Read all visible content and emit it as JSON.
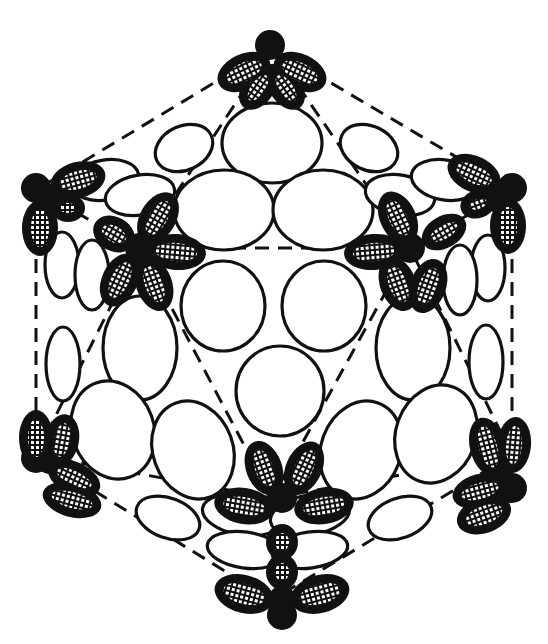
{
  "diagram": {
    "width": 548,
    "height": 644,
    "colors": {
      "background": "#ffffff",
      "stroke": "#111111",
      "penton_fill": "#111111",
      "hatch_bg": "#ffffff"
    },
    "edges": [
      [
        272,
        48,
        512,
        190
      ],
      [
        272,
        48,
        36,
        190
      ],
      [
        36,
        190,
        36,
        455
      ],
      [
        512,
        190,
        512,
        455
      ],
      [
        36,
        455,
        272,
        600
      ],
      [
        512,
        455,
        272,
        600
      ],
      [
        140,
        248,
        410,
        248
      ],
      [
        140,
        248,
        272,
        498
      ],
      [
        410,
        248,
        272,
        498
      ],
      [
        272,
        48,
        140,
        248
      ],
      [
        272,
        48,
        410,
        248
      ],
      [
        36,
        190,
        140,
        248
      ],
      [
        512,
        190,
        410,
        248
      ],
      [
        36,
        455,
        140,
        248
      ],
      [
        512,
        455,
        410,
        248
      ],
      [
        36,
        455,
        272,
        498
      ],
      [
        512,
        455,
        272,
        498
      ]
    ],
    "hexons": [
      {
        "cx": 272,
        "cy": 143,
        "rx": 50,
        "ry": 40,
        "rot": 0
      },
      {
        "cx": 224,
        "cy": 210,
        "rx": 50,
        "ry": 40,
        "rot": 0
      },
      {
        "cx": 323,
        "cy": 210,
        "rx": 50,
        "ry": 40,
        "rot": 0
      },
      {
        "cx": 223,
        "cy": 306,
        "rx": 42,
        "ry": 45,
        "rot": 0
      },
      {
        "cx": 324,
        "cy": 306,
        "rx": 42,
        "ry": 45,
        "rot": 0
      },
      {
        "cx": 280,
        "cy": 391,
        "rx": 44,
        "ry": 45,
        "rot": 0
      },
      {
        "cx": 140,
        "cy": 348,
        "rx": 37,
        "ry": 52,
        "rot": 0
      },
      {
        "cx": 113,
        "cy": 430,
        "rx": 41,
        "ry": 50,
        "rot": -20
      },
      {
        "cx": 193,
        "cy": 450,
        "rx": 40,
        "ry": 50,
        "rot": -20
      },
      {
        "cx": 413,
        "cy": 348,
        "rx": 37,
        "ry": 52,
        "rot": 0
      },
      {
        "cx": 361,
        "cy": 450,
        "rx": 40,
        "ry": 50,
        "rot": 20
      },
      {
        "cx": 436,
        "cy": 434,
        "rx": 40,
        "ry": 50,
        "rot": 20
      },
      {
        "cx": 184,
        "cy": 148,
        "rx": 30,
        "ry": 22,
        "rot": -25
      },
      {
        "cx": 369,
        "cy": 148,
        "rx": 30,
        "ry": 22,
        "rot": 25
      },
      {
        "cx": 105,
        "cy": 180,
        "rx": 34,
        "ry": 20,
        "rot": -10
      },
      {
        "cx": 140,
        "cy": 195,
        "rx": 35,
        "ry": 20,
        "rot": -10
      },
      {
        "cx": 400,
        "cy": 195,
        "rx": 35,
        "ry": 20,
        "rot": 10
      },
      {
        "cx": 445,
        "cy": 180,
        "rx": 34,
        "ry": 20,
        "rot": 10
      },
      {
        "cx": 62,
        "cy": 265,
        "rx": 17,
        "ry": 33,
        "rot": 0
      },
      {
        "cx": 92,
        "cy": 275,
        "rx": 17,
        "ry": 35,
        "rot": 0
      },
      {
        "cx": 63,
        "cy": 364,
        "rx": 17,
        "ry": 37,
        "rot": 0
      },
      {
        "cx": 488,
        "cy": 268,
        "rx": 17,
        "ry": 33,
        "rot": 0
      },
      {
        "cx": 460,
        "cy": 280,
        "rx": 17,
        "ry": 35,
        "rot": 0
      },
      {
        "cx": 486,
        "cy": 362,
        "rx": 17,
        "ry": 37,
        "rot": 0
      },
      {
        "cx": 168,
        "cy": 518,
        "rx": 33,
        "ry": 20,
        "rot": 20
      },
      {
        "cx": 400,
        "cy": 518,
        "rx": 33,
        "ry": 20,
        "rot": -20
      },
      {
        "cx": 242,
        "cy": 515,
        "rx": 40,
        "ry": 20,
        "rot": 10
      },
      {
        "cx": 310,
        "cy": 515,
        "rx": 40,
        "ry": 20,
        "rot": -10
      },
      {
        "cx": 245,
        "cy": 550,
        "rx": 38,
        "ry": 18,
        "rot": 8
      },
      {
        "cx": 310,
        "cy": 550,
        "rx": 38,
        "ry": 18,
        "rot": -8
      }
    ],
    "pentons": [
      {
        "name": "top",
        "cx": 272,
        "cy": 78,
        "core": [
          270,
          45
        ],
        "petals": [
          {
            "dx": -28,
            "dy": -6,
            "rx": 24,
            "ry": 14,
            "rot": -25
          },
          {
            "dx": 28,
            "dy": -6,
            "rx": 24,
            "ry": 14,
            "rot": 25
          },
          {
            "dx": -14,
            "dy": 10,
            "rx": 20,
            "ry": 12,
            "rot": -55
          },
          {
            "dx": 14,
            "dy": 10,
            "rx": 20,
            "ry": 12,
            "rot": 55
          }
        ]
      },
      {
        "name": "upper-left-outer",
        "cx": 52,
        "cy": 198,
        "core": [
          36,
          188
        ],
        "petals": [
          {
            "dx": 26,
            "dy": -18,
            "rx": 24,
            "ry": 14,
            "rot": -15
          },
          {
            "dx": -12,
            "dy": 30,
            "rx": 14,
            "ry": 24,
            "rot": 0
          },
          {
            "dx": 16,
            "dy": 10,
            "rx": 13,
            "ry": 10,
            "rot": 0
          }
        ]
      },
      {
        "name": "upper-left-inner",
        "cx": 140,
        "cy": 248,
        "core": [
          140,
          248
        ],
        "petals": [
          {
            "dx": 18,
            "dy": -30,
            "rx": 24,
            "ry": 14,
            "rot": -60
          },
          {
            "dx": 36,
            "dy": 4,
            "rx": 26,
            "ry": 14,
            "rot": 5
          },
          {
            "dx": 14,
            "dy": 36,
            "rx": 24,
            "ry": 14,
            "rot": 70
          },
          {
            "dx": -20,
            "dy": 32,
            "rx": 24,
            "ry": 14,
            "rot": -65
          },
          {
            "dx": -26,
            "dy": -14,
            "rx": 18,
            "ry": 13,
            "rot": 30
          }
        ]
      },
      {
        "name": "upper-right-outer",
        "cx": 496,
        "cy": 198,
        "core": [
          512,
          188
        ],
        "petals": [
          {
            "dx": -22,
            "dy": -24,
            "rx": 24,
            "ry": 14,
            "rot": 25
          },
          {
            "dx": 12,
            "dy": 28,
            "rx": 14,
            "ry": 24,
            "rot": 0
          },
          {
            "dx": -18,
            "dy": 6,
            "rx": 14,
            "ry": 10,
            "rot": -20
          }
        ]
      },
      {
        "name": "upper-right-inner",
        "cx": 410,
        "cy": 248,
        "core": [
          410,
          248
        ],
        "petals": [
          {
            "dx": -12,
            "dy": -30,
            "rx": 24,
            "ry": 14,
            "rot": 65
          },
          {
            "dx": 34,
            "dy": -16,
            "rx": 20,
            "ry": 12,
            "rot": -30
          },
          {
            "dx": -36,
            "dy": 4,
            "rx": 26,
            "ry": 14,
            "rot": -5
          },
          {
            "dx": -12,
            "dy": 36,
            "rx": 24,
            "ry": 14,
            "rot": 70
          },
          {
            "dx": 18,
            "dy": 38,
            "rx": 24,
            "ry": 14,
            "rot": -70
          }
        ]
      },
      {
        "name": "lower-left",
        "cx": 50,
        "cy": 460,
        "core": [
          36,
          458
        ],
        "petals": [
          {
            "dx": -14,
            "dy": -22,
            "rx": 13,
            "ry": 24,
            "rot": 0
          },
          {
            "dx": 12,
            "dy": -20,
            "rx": 13,
            "ry": 22,
            "rot": 10
          },
          {
            "dx": 24,
            "dy": 18,
            "rx": 24,
            "ry": 12,
            "rot": 25
          },
          {
            "dx": 22,
            "dy": 40,
            "rx": 26,
            "ry": 13,
            "rot": 15
          }
        ]
      },
      {
        "name": "lower-right",
        "cx": 500,
        "cy": 465,
        "core": [
          512,
          488
        ],
        "petals": [
          {
            "dx": -12,
            "dy": -18,
            "rx": 14,
            "ry": 26,
            "rot": -15
          },
          {
            "dx": 14,
            "dy": -20,
            "rx": 13,
            "ry": 24,
            "rot": 5
          },
          {
            "dx": -20,
            "dy": 26,
            "rx": 24,
            "ry": 13,
            "rot": -15
          },
          {
            "dx": -16,
            "dy": 50,
            "rx": 24,
            "ry": 14,
            "rot": -20
          }
        ]
      },
      {
        "name": "bottom-inner",
        "cx": 282,
        "cy": 498,
        "core": [
          282,
          498
        ],
        "petals": [
          {
            "dx": -18,
            "dy": -30,
            "rx": 24,
            "ry": 14,
            "rot": 70
          },
          {
            "dx": 22,
            "dy": -30,
            "rx": 24,
            "ry": 14,
            "rot": -65
          },
          {
            "dx": -38,
            "dy": 8,
            "rx": 26,
            "ry": 14,
            "rot": 10
          },
          {
            "dx": 42,
            "dy": 8,
            "rx": 26,
            "ry": 14,
            "rot": -10
          }
        ]
      },
      {
        "name": "bottom-outer",
        "cx": 282,
        "cy": 600,
        "core": [
          282,
          615
        ],
        "petals": [
          {
            "dx": -38,
            "dy": -6,
            "rx": 26,
            "ry": 15,
            "rot": 15
          },
          {
            "dx": 38,
            "dy": -6,
            "rx": 26,
            "ry": 15,
            "rot": -15
          },
          {
            "dx": 0,
            "dy": -58,
            "rx": 12,
            "ry": 14,
            "rot": 0
          },
          {
            "dx": 0,
            "dy": -28,
            "rx": 12,
            "ry": 14,
            "rot": 0
          }
        ]
      }
    ]
  }
}
